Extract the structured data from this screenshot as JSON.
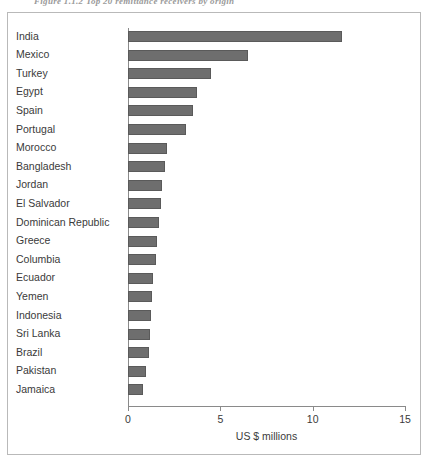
{
  "figure": {
    "caption": "Figure 1.1.2   Top 20 remittance receivers by origin"
  },
  "chart_data": {
    "type": "bar",
    "orientation": "horizontal",
    "title": "",
    "xlabel": "US $ millions",
    "ylabel": "",
    "xlim": [
      0,
      15
    ],
    "xticks": [
      0,
      5,
      10,
      15
    ],
    "xtick_labels": [
      "0",
      "5",
      "10",
      "15"
    ],
    "grid": false,
    "legend": null,
    "bar_color": "#6e6e6e",
    "categories": [
      "India",
      "Mexico",
      "Turkey",
      "Egypt",
      "Spain",
      "Portugal",
      "Morocco",
      "Bangladesh",
      "Jordan",
      "El Salvador",
      "Dominican Republic",
      "Greece",
      "Columbia",
      "Ecuador",
      "Yemen",
      "Indonesia",
      "Sri Lanka",
      "Brazil",
      "Pakistan",
      "Jamaica"
    ],
    "values": [
      11.6,
      6.5,
      4.5,
      3.75,
      3.5,
      3.15,
      2.1,
      2.0,
      1.85,
      1.8,
      1.7,
      1.55,
      1.5,
      1.35,
      1.3,
      1.25,
      1.2,
      1.15,
      1.0,
      0.8
    ]
  }
}
